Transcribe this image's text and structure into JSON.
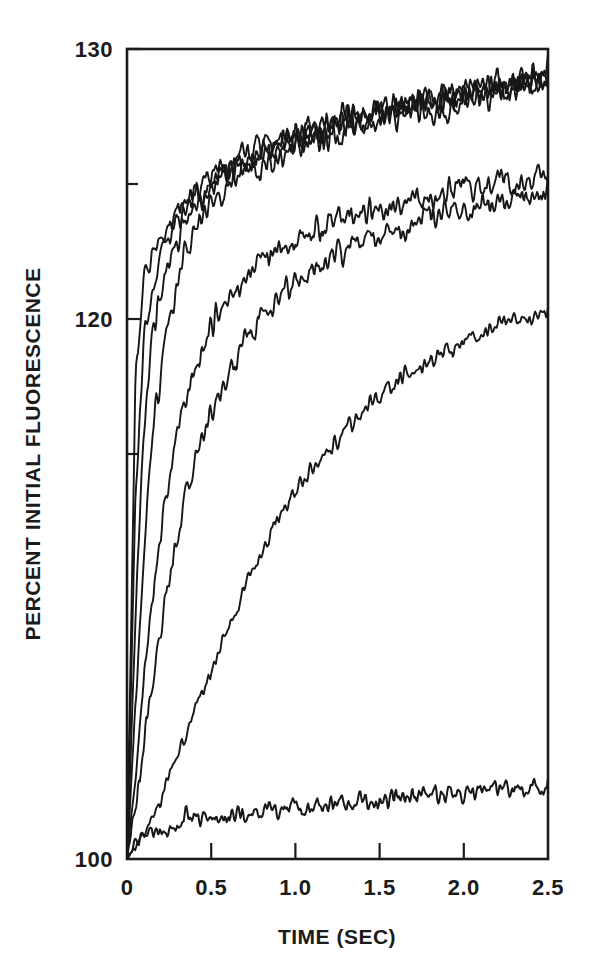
{
  "figure": {
    "background": "#ffffff",
    "ink_color": "#171717"
  },
  "chart_data": {
    "type": "line",
    "title": "",
    "subtitle": "",
    "xlabel": "TIME (SEC)",
    "ylabel": "PERCENT INITIAL FLUORESCENCE",
    "xlim": [
      0,
      2.5
    ],
    "ylim": [
      100,
      130
    ],
    "grid": false,
    "legend": "none",
    "x_ticks": [
      0,
      0.5,
      1.0,
      1.5,
      2.0,
      2.5
    ],
    "x_tick_labels": [
      "0",
      "0.5",
      "1.0",
      "1.5",
      "2.0",
      "2.5"
    ],
    "y_ticks": [
      100,
      120,
      130
    ],
    "y_tick_labels": [
      "100",
      "120",
      "130"
    ],
    "y_minor_ticks": [
      115,
      125
    ],
    "x": [
      0,
      0.05,
      0.1,
      0.15,
      0.2,
      0.25,
      0.3,
      0.35,
      0.4,
      0.45,
      0.5,
      0.55,
      0.6,
      0.65,
      0.7,
      0.75,
      0.8,
      0.85,
      0.9,
      0.95,
      1.0,
      1.05,
      1.1,
      1.15,
      1.2,
      1.25,
      1.3,
      1.35,
      1.4,
      1.45,
      1.5,
      1.55,
      1.6,
      1.65,
      1.7,
      1.75,
      1.8,
      1.85,
      1.9,
      1.95,
      2.0,
      2.05,
      2.1,
      2.15,
      2.2,
      2.25,
      2.3,
      2.35,
      2.4,
      2.45,
      2.5
    ],
    "series": [
      {
        "name": "trace-1-fastest",
        "noise": 0.85,
        "values": [
          100.0,
          117.6,
          121.4,
          122.3,
          122.9,
          123.4,
          123.9,
          124.3,
          124.6,
          124.9,
          125.2,
          125.4,
          125.6,
          125.8,
          126.0,
          126.1,
          126.3,
          126.4,
          126.5,
          126.7,
          126.8,
          126.9,
          127.0,
          127.1,
          127.2,
          127.3,
          127.4,
          127.5,
          127.6,
          127.6,
          127.7,
          127.8,
          127.9,
          127.9,
          128.0,
          128.1,
          128.2,
          128.2,
          128.3,
          128.4,
          128.4,
          128.5,
          128.6,
          128.6,
          128.7,
          128.8,
          128.8,
          128.9,
          129.0,
          129.0,
          129.1
        ]
      },
      {
        "name": "trace-2-fast",
        "noise": 0.85,
        "values": [
          100.0,
          113.5,
          119.2,
          121.3,
          122.4,
          123.1,
          123.7,
          124.1,
          124.5,
          124.8,
          125.1,
          125.3,
          125.5,
          125.7,
          125.9,
          126.0,
          126.2,
          126.3,
          126.4,
          126.6,
          126.7,
          126.8,
          126.9,
          127.0,
          127.1,
          127.2,
          127.3,
          127.4,
          127.4,
          127.5,
          127.6,
          127.7,
          127.8,
          127.8,
          127.9,
          128.0,
          128.0,
          128.1,
          128.2,
          128.2,
          128.3,
          128.4,
          128.4,
          128.5,
          128.6,
          128.6,
          128.7,
          128.8,
          128.8,
          128.9,
          128.9
        ]
      },
      {
        "name": "trace-3-fast-b",
        "noise": 0.9,
        "values": [
          100.0,
          109.0,
          115.8,
          119.3,
          121.1,
          122.2,
          123.0,
          123.6,
          124.1,
          124.5,
          124.8,
          125.1,
          125.4,
          125.6,
          125.8,
          126.0,
          126.1,
          126.3,
          126.4,
          126.6,
          126.7,
          126.8,
          126.9,
          127.0,
          127.1,
          127.2,
          127.3,
          127.4,
          127.5,
          127.5,
          127.6,
          127.7,
          127.8,
          127.9,
          127.9,
          128.0,
          128.1,
          128.1,
          128.2,
          128.3,
          128.3,
          128.4,
          128.5,
          128.5,
          128.6,
          128.7,
          128.7,
          128.8,
          128.9,
          128.9,
          129.0
        ]
      },
      {
        "name": "trace-4-medium-fast",
        "noise": 0.95,
        "values": [
          100.0,
          105.6,
          111.3,
          115.4,
          118.2,
          120.1,
          121.4,
          122.4,
          123.1,
          123.7,
          124.1,
          124.5,
          124.8,
          125.1,
          125.3,
          125.5,
          125.7,
          125.9,
          126.0,
          126.2,
          126.3,
          126.5,
          126.6,
          126.7,
          126.8,
          126.9,
          127.0,
          127.1,
          127.2,
          127.3,
          127.4,
          127.5,
          127.5,
          127.6,
          127.7,
          127.8,
          127.8,
          127.9,
          128.0,
          128.1,
          128.1,
          128.2,
          128.3,
          128.3,
          128.4,
          128.5,
          128.5,
          128.6,
          128.7,
          128.7,
          128.8
        ]
      },
      {
        "name": "trace-5-medium",
        "noise": 0.85,
        "values": [
          100.0,
          103.1,
          106.6,
          109.6,
          112.1,
          114.1,
          115.7,
          117.0,
          118.1,
          118.9,
          119.6,
          120.2,
          120.7,
          121.1,
          121.5,
          121.8,
          122.1,
          122.3,
          122.5,
          122.7,
          122.9,
          123.0,
          123.2,
          123.3,
          123.4,
          123.6,
          123.7,
          123.8,
          123.9,
          124.0,
          124.1,
          124.1,
          124.2,
          124.3,
          124.4,
          124.5,
          124.5,
          124.6,
          124.7,
          124.7,
          124.8,
          124.9,
          124.9,
          125.0,
          125.1,
          125.1,
          125.2,
          125.2,
          125.3,
          125.4,
          125.4
        ]
      },
      {
        "name": "trace-6-medium-slow",
        "noise": 0.8,
        "values": [
          100.0,
          102.0,
          104.3,
          106.5,
          108.5,
          110.3,
          111.9,
          113.3,
          114.5,
          115.6,
          116.5,
          117.3,
          118.0,
          118.6,
          119.2,
          119.6,
          120.1,
          120.4,
          120.8,
          121.1,
          121.4,
          121.6,
          121.8,
          122.0,
          122.2,
          122.4,
          122.6,
          122.7,
          122.9,
          123.0,
          123.1,
          123.2,
          123.3,
          123.4,
          123.5,
          123.6,
          123.7,
          123.8,
          123.9,
          124.0,
          124.0,
          124.1,
          124.2,
          124.2,
          124.3,
          124.4,
          124.4,
          124.5,
          124.5,
          124.6,
          124.7
        ]
      },
      {
        "name": "trace-7-slow",
        "noise": 0.55,
        "values": [
          100.0,
          100.4,
          100.9,
          101.5,
          102.2,
          103.0,
          103.8,
          104.6,
          105.4,
          106.2,
          107.0,
          107.8,
          108.5,
          109.3,
          110.0,
          110.6,
          111.3,
          111.9,
          112.4,
          113.0,
          113.5,
          114.0,
          114.4,
          114.8,
          115.2,
          115.6,
          115.9,
          116.3,
          116.6,
          116.9,
          117.1,
          117.4,
          117.6,
          117.9,
          118.1,
          118.3,
          118.5,
          118.7,
          118.8,
          119.0,
          119.2,
          119.3,
          119.4,
          119.6,
          119.7,
          119.8,
          119.9,
          120.0,
          120.0,
          120.1,
          120.2
        ]
      },
      {
        "name": "trace-8-baseline",
        "noise": 0.62,
        "values": [
          100.0,
          100.5,
          100.8,
          101.0,
          101.1,
          101.2,
          101.3,
          101.4,
          101.4,
          101.5,
          101.5,
          101.6,
          101.6,
          101.7,
          101.7,
          101.7,
          101.8,
          101.8,
          101.8,
          101.9,
          101.9,
          101.9,
          102.0,
          102.0,
          102.0,
          102.1,
          102.1,
          102.1,
          102.2,
          102.2,
          102.2,
          102.2,
          102.3,
          102.3,
          102.3,
          102.3,
          102.4,
          102.4,
          102.4,
          102.4,
          102.5,
          102.5,
          102.5,
          102.5,
          102.6,
          102.6,
          102.6,
          102.6,
          102.7,
          102.7,
          102.7
        ]
      }
    ]
  }
}
